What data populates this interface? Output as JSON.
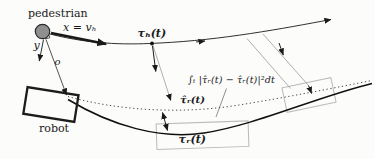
{
  "figure": {
    "labels": {
      "pedestrian": "pedestrian",
      "x_axis": "x = vₕ",
      "y_axis": "y",
      "origin": "o",
      "human_trajectory": "τₕ(t)",
      "robot": "robot",
      "integral": "∫ₜ |τ̂ᵣ(t) − τ̂ᵣ(t)|²dt",
      "predicted_robot_trajectory": "τ̂ᵣ(t)",
      "actual_robot_trajectory": "τᵣ(t)"
    },
    "colors": {
      "background": "#fcfcfa",
      "ink": "#1a1a1a",
      "pedestrian_fill": "#8f8f8f",
      "muted_line": "#8c8c8c",
      "light_box": "#b9b9b9"
    }
  }
}
